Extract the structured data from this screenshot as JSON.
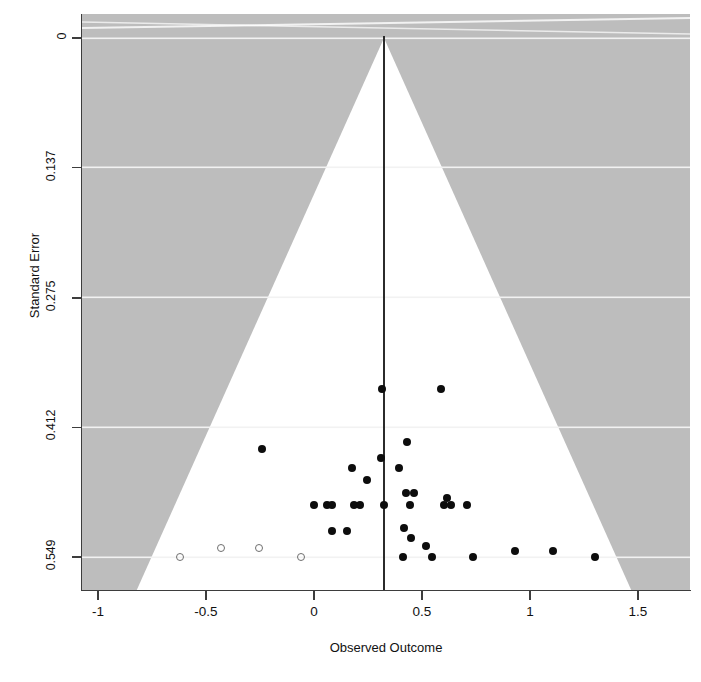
{
  "chart_data": {
    "type": "scatter",
    "subtype": "funnel-plot",
    "title": "",
    "xlabel": "Observed Outcome",
    "ylabel": "Standard Error",
    "xlim": [
      -1.075,
      1.74
    ],
    "ylim": [
      0.6,
      -0.0115
    ],
    "grid": false,
    "legend": null,
    "xticks": [
      -1,
      -0.5,
      0,
      1.5,
      1
    ],
    "xtick_labels": [
      "-1",
      "-0.5",
      "0",
      "0.5",
      "1",
      "1.5"
    ],
    "xtick_values": [
      -1,
      -0.5,
      0,
      0.5,
      1,
      1.5
    ],
    "ytick_labels": [
      "0",
      "0.137",
      "0.275",
      "0.412",
      "0.549"
    ],
    "ytick_values": [
      0,
      0.137,
      0.275,
      0.412,
      0.549
    ],
    "reference_line_x": 0.324,
    "funnel": {
      "apex_x": 0.324,
      "apex_y": 0,
      "slope_ci": 1.96,
      "inside_color": "#ffffff",
      "outside_color": "#bdbdbd"
    },
    "series": [
      {
        "name": "Observed studies",
        "marker": "filled-circle",
        "color": "#0d0d0d",
        "points": [
          {
            "x": 0.315,
            "y": 0.371
          },
          {
            "x": 0.59,
            "y": 0.371
          },
          {
            "x": -0.24,
            "y": 0.435
          },
          {
            "x": 0.175,
            "y": 0.455
          },
          {
            "x": 0.395,
            "y": 0.455
          },
          {
            "x": 0.31,
            "y": 0.444
          },
          {
            "x": 0.43,
            "y": 0.427
          },
          {
            "x": 0.245,
            "y": 0.468
          },
          {
            "x": 0.425,
            "y": 0.481
          },
          {
            "x": 0.465,
            "y": 0.481
          },
          {
            "x": 0.615,
            "y": 0.487
          },
          {
            "x": 0.0,
            "y": 0.494
          },
          {
            "x": 0.06,
            "y": 0.494
          },
          {
            "x": 0.085,
            "y": 0.494
          },
          {
            "x": 0.185,
            "y": 0.494
          },
          {
            "x": 0.215,
            "y": 0.494
          },
          {
            "x": 0.324,
            "y": 0.494
          },
          {
            "x": 0.445,
            "y": 0.494
          },
          {
            "x": 0.6,
            "y": 0.494
          },
          {
            "x": 0.635,
            "y": 0.494
          },
          {
            "x": 0.71,
            "y": 0.494
          },
          {
            "x": 0.085,
            "y": 0.521
          },
          {
            "x": 0.155,
            "y": 0.521
          },
          {
            "x": 0.415,
            "y": 0.518
          },
          {
            "x": 0.45,
            "y": 0.529
          },
          {
            "x": 0.52,
            "y": 0.537
          },
          {
            "x": 0.41,
            "y": 0.549
          },
          {
            "x": 0.545,
            "y": 0.549
          },
          {
            "x": 0.735,
            "y": 0.549
          },
          {
            "x": 0.93,
            "y": 0.543
          },
          {
            "x": 1.105,
            "y": 0.543
          },
          {
            "x": 1.3,
            "y": 0.549
          }
        ]
      },
      {
        "name": "Imputed studies (trim-and-fill)",
        "marker": "open-circle",
        "color": "#6f6f6f",
        "points": [
          {
            "x": -0.62,
            "y": 0.549
          },
          {
            "x": -0.43,
            "y": 0.54
          },
          {
            "x": -0.255,
            "y": 0.54
          },
          {
            "x": -0.06,
            "y": 0.549
          }
        ]
      }
    ]
  },
  "axes": {
    "x_title": "Observed Outcome",
    "y_title": "Standard Error"
  }
}
